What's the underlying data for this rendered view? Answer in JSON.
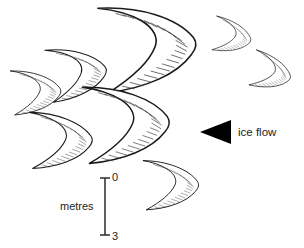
{
  "figure": {
    "background_color": "#ffffff",
    "width": 304,
    "height": 248
  },
  "annotations": {
    "ice_flow_label": "ice flow",
    "ice_flow_arrow_direction": "left",
    "ice_flow_arrow_color": "#000000"
  },
  "scale_bar": {
    "label": "metres",
    "top_tick_label": "0",
    "bottom_tick_label": "3",
    "orientation": "vertical",
    "color": "#2b2b2b"
  },
  "bedforms": {
    "outline_color": "#1a1a1a",
    "hatch_color": "#3a3a3a",
    "fill_color": "#ffffff",
    "count": 9,
    "opening_direction": "left",
    "items": [
      {
        "id": "crescent-1",
        "size": "large",
        "cx": 150,
        "cy": 45,
        "scale": 1.0,
        "rotation": -6
      },
      {
        "id": "crescent-2",
        "size": "medium",
        "cx": 78,
        "cy": 72,
        "scale": 0.62,
        "rotation": -8
      },
      {
        "id": "crescent-3",
        "size": "medium",
        "cx": 37,
        "cy": 91,
        "scale": 0.52,
        "rotation": -4
      },
      {
        "id": "crescent-4",
        "size": "small",
        "cx": 233,
        "cy": 36,
        "scale": 0.4,
        "rotation": 10
      },
      {
        "id": "crescent-5",
        "size": "small",
        "cx": 272,
        "cy": 72,
        "scale": 0.42,
        "rotation": 14
      },
      {
        "id": "crescent-6",
        "size": "large",
        "cx": 128,
        "cy": 122,
        "scale": 0.9,
        "rotation": -4
      },
      {
        "id": "crescent-7",
        "size": "medium",
        "cx": 62,
        "cy": 139,
        "scale": 0.66,
        "rotation": -2
      },
      {
        "id": "crescent-8",
        "size": "medium",
        "cx": 172,
        "cy": 184,
        "scale": 0.58,
        "rotation": -2
      }
    ]
  }
}
